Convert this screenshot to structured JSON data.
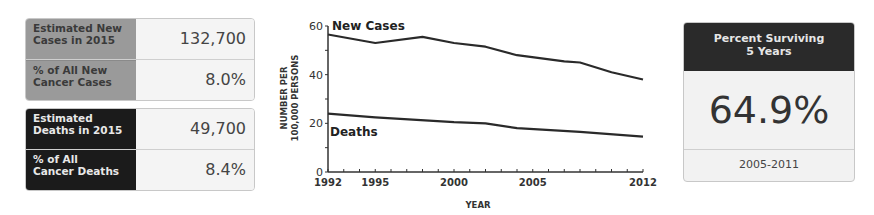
{
  "stats": {
    "new_cases": {
      "label": "Estimated New Cases in 2015",
      "label_l1": "Estimated New",
      "label_l2": "Cases in 2015",
      "value": "132,700"
    },
    "pct_new": {
      "label_l1": "% of All New",
      "label_l2": "Cancer Cases",
      "value": "8.0%"
    },
    "deaths": {
      "label_l1": "Estimated",
      "label_l2": "Deaths in 2015",
      "value": "49,700"
    },
    "pct_deaths": {
      "label_l1": "% of All",
      "label_l2": "Cancer Deaths",
      "value": "8.4%"
    }
  },
  "survival": {
    "title_l1": "Percent Surviving",
    "title_l2": "5 Years",
    "value": "64.9%",
    "range": "2005-2011"
  },
  "chart_data": {
    "type": "line",
    "title": "",
    "xlabel": "YEAR",
    "ylabel_l1": "NUMBER PER",
    "ylabel_l2": "100,000 PERSONS",
    "ylabel": "NUMBER PER 100,000 PERSONS",
    "xlim": [
      1992,
      2012
    ],
    "ylim": [
      0,
      60
    ],
    "x_ticks": [
      "1992",
      "1995",
      "2000",
      "2005",
      "2012"
    ],
    "y_ticks": [
      "0",
      "20",
      "40",
      "60"
    ],
    "grid": false,
    "legend_position": "inline labels",
    "series": [
      {
        "name": "New Cases",
        "x": [
          1992,
          1995,
          1998,
          2000,
          2002,
          2004,
          2007,
          2008,
          2010,
          2012
        ],
        "values": [
          56.5,
          53,
          55.5,
          53,
          51.5,
          48,
          45.5,
          45,
          41,
          38
        ]
      },
      {
        "name": "Deaths",
        "x": [
          1992,
          1995,
          2000,
          2002,
          2004,
          2008,
          2012
        ],
        "values": [
          24,
          22.5,
          20.5,
          20,
          18,
          16.5,
          14.5
        ]
      }
    ]
  }
}
